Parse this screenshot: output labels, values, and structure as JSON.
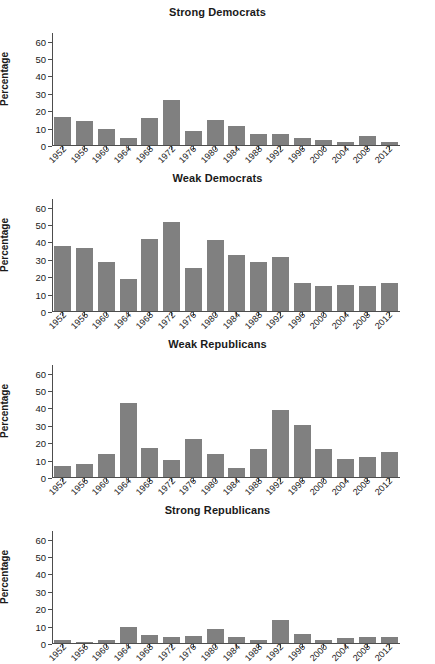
{
  "figure": {
    "ylabel": "Percentage",
    "yticks": [
      0,
      10,
      20,
      30,
      40,
      50,
      60
    ],
    "ylim": [
      0,
      65
    ],
    "bar_color": "#808080",
    "axis_color": "#4d4d4d"
  },
  "chart_data": [
    {
      "type": "bar",
      "title": "Strong Democrats",
      "xlabel": "",
      "ylabel": "Percentage",
      "ylim": [
        0,
        65
      ],
      "yticks": [
        0,
        10,
        20,
        30,
        40,
        50,
        60
      ],
      "grid": false,
      "legend": "none",
      "categories": [
        "1952",
        "1956",
        "1960",
        "1964",
        "1968",
        "1972",
        "1976",
        "1980",
        "1984",
        "1988",
        "1992",
        "1996",
        "2000",
        "2004",
        "2008",
        "2012"
      ],
      "values": [
        16.2,
        14.1,
        9.1,
        4.3,
        15.4,
        26.0,
        8.2,
        14.3,
        11.1,
        6.3,
        6.3,
        4.1,
        2.9,
        1.7,
        4.9,
        1.6
      ]
    },
    {
      "type": "bar",
      "title": "Weak Democrats",
      "xlabel": "",
      "ylabel": "Percentage",
      "ylim": [
        0,
        65
      ],
      "yticks": [
        0,
        10,
        20,
        30,
        40,
        50,
        60
      ],
      "grid": false,
      "legend": "none",
      "categories": [
        "1952",
        "1956",
        "1960",
        "1964",
        "1968",
        "1972",
        "1976",
        "1980",
        "1984",
        "1988",
        "1992",
        "1996",
        "2000",
        "2004",
        "2008",
        "2012"
      ],
      "values": [
        37.6,
        36.5,
        28.0,
        18.2,
        41.5,
        51.3,
        25.0,
        40.7,
        32.0,
        28.0,
        31.0,
        16.1,
        14.2,
        15.2,
        14.6,
        16.0
      ]
    },
    {
      "type": "bar",
      "title": "Weak Republicans",
      "xlabel": "",
      "ylabel": "Percentage",
      "ylim": [
        0,
        65
      ],
      "yticks": [
        0,
        10,
        20,
        30,
        40,
        50,
        60
      ],
      "grid": false,
      "legend": "none",
      "categories": [
        "1952",
        "1956",
        "1960",
        "1964",
        "1968",
        "1972",
        "1976",
        "1980",
        "1984",
        "1988",
        "1992",
        "1996",
        "2000",
        "2004",
        "2008",
        "2012"
      ],
      "values": [
        6.3,
        7.4,
        13.1,
        42.7,
        16.9,
        9.5,
        22.0,
        13.3,
        5.2,
        16.0,
        38.5,
        29.9,
        16.0,
        10.3,
        11.3,
        14.2
      ]
    },
    {
      "type": "bar",
      "title": "Strong Republicans",
      "xlabel": "",
      "ylabel": "Percentage",
      "ylim": [
        0,
        65
      ],
      "yticks": [
        0,
        10,
        20,
        30,
        40,
        50,
        60
      ],
      "grid": false,
      "legend": "none",
      "categories": [
        "1952",
        "1956",
        "1960",
        "1964",
        "1968",
        "1972",
        "1976",
        "1980",
        "1984",
        "1988",
        "1992",
        "1996",
        "2000",
        "2004",
        "2008",
        "2012"
      ],
      "values": [
        1.5,
        0.6,
        1.6,
        9.3,
        4.4,
        3.2,
        3.9,
        8.2,
        3.6,
        1.6,
        13.2,
        5.4,
        1.5,
        2.6,
        3.3,
        3.2
      ]
    }
  ]
}
